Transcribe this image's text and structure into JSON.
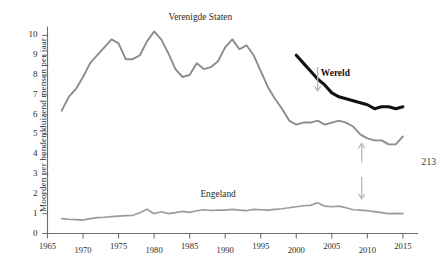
{
  "page": {
    "page_number": "213"
  },
  "chart_data": {
    "type": "line",
    "title": "",
    "xlabel": "",
    "ylabel": "Moorden per honderdduizend mensen per jaar",
    "xlim": [
      1965,
      2016
    ],
    "ylim": [
      0,
      10.5
    ],
    "grid": false,
    "legend_position": "inline-annotations",
    "xticks": [
      "1965",
      "1970",
      "1975",
      "1980",
      "1985",
      "1990",
      "1995",
      "2000",
      "2005",
      "2010",
      "2015"
    ],
    "xtick_values": [
      1965,
      1970,
      1975,
      1980,
      1985,
      1990,
      1995,
      2000,
      2005,
      2010,
      2015
    ],
    "yticks": [
      "0",
      "1",
      "2",
      "3",
      "4",
      "5",
      "6",
      "7",
      "8",
      "9",
      "10"
    ],
    "ytick_values": [
      0,
      1,
      2,
      3,
      4,
      5,
      6,
      7,
      8,
      9,
      10
    ],
    "colors": {
      "verenigde_staten": "#8c8c8c",
      "engeland": "#9b9b9b",
      "wereld": "#111111",
      "axis": "#6e6e6e",
      "arrow": "#b8b8b8"
    },
    "series": [
      {
        "name": "Verenigde Staten",
        "color": "#8c8c8c",
        "width": 1.9,
        "label_x": 1986.5,
        "label_y": 10.9,
        "x": [
          1967,
          1968,
          1969,
          1970,
          1971,
          1972,
          1973,
          1974,
          1975,
          1976,
          1977,
          1978,
          1979,
          1980,
          1981,
          1982,
          1983,
          1984,
          1985,
          1986,
          1987,
          1988,
          1989,
          1990,
          1991,
          1992,
          1993,
          1994,
          1995,
          1996,
          1997,
          1998,
          1999,
          2000,
          2001,
          2002,
          2003,
          2004,
          2005,
          2006,
          2007,
          2008,
          2009,
          2010,
          2011,
          2012,
          2013,
          2014,
          2015
        ],
        "y": [
          6.2,
          6.9,
          7.3,
          7.9,
          8.6,
          9.0,
          9.4,
          9.8,
          9.6,
          8.8,
          8.8,
          9.0,
          9.7,
          10.2,
          9.8,
          9.1,
          8.3,
          7.9,
          8.0,
          8.6,
          8.3,
          8.4,
          8.7,
          9.4,
          9.8,
          9.3,
          9.5,
          9.0,
          8.2,
          7.4,
          6.8,
          6.3,
          5.7,
          5.5,
          5.6,
          5.6,
          5.7,
          5.5,
          5.6,
          5.7,
          5.6,
          5.4,
          5.0,
          4.8,
          4.7,
          4.7,
          4.5,
          4.5,
          4.9
        ]
      },
      {
        "name": "Engeland",
        "color": "#9b9b9b",
        "width": 1.7,
        "label_x": 1989.0,
        "label_y": 1.95,
        "x": [
          1967,
          1968,
          1969,
          1970,
          1971,
          1972,
          1973,
          1974,
          1975,
          1976,
          1977,
          1978,
          1979,
          1980,
          1981,
          1982,
          1983,
          1984,
          1985,
          1986,
          1987,
          1988,
          1989,
          1990,
          1991,
          1992,
          1993,
          1994,
          1995,
          1996,
          1997,
          1998,
          1999,
          2000,
          2001,
          2002,
          2003,
          2004,
          2005,
          2006,
          2007,
          2008,
          2009,
          2010,
          2011,
          2012,
          2013,
          2014,
          2015
        ],
        "y": [
          0.75,
          0.72,
          0.7,
          0.68,
          0.75,
          0.8,
          0.82,
          0.85,
          0.88,
          0.9,
          0.92,
          1.05,
          1.22,
          1.0,
          1.1,
          1.0,
          1.05,
          1.12,
          1.07,
          1.15,
          1.2,
          1.16,
          1.18,
          1.18,
          1.22,
          1.18,
          1.15,
          1.22,
          1.2,
          1.18,
          1.22,
          1.25,
          1.3,
          1.35,
          1.4,
          1.42,
          1.55,
          1.38,
          1.35,
          1.38,
          1.3,
          1.2,
          1.18,
          1.15,
          1.1,
          1.05,
          1.0,
          1.02,
          1.0
        ]
      },
      {
        "name": "Wereld",
        "color": "#111111",
        "width": 3.1,
        "label_x": 2005.5,
        "label_y": 8.05,
        "x": [
          2000,
          2001,
          2002,
          2003,
          2004,
          2005,
          2006,
          2007,
          2008,
          2009,
          2010,
          2011,
          2012,
          2013,
          2014,
          2015
        ],
        "y": [
          9.0,
          8.6,
          8.2,
          7.8,
          7.5,
          7.1,
          6.9,
          6.8,
          6.7,
          6.6,
          6.5,
          6.3,
          6.4,
          6.4,
          6.3,
          6.4
        ]
      }
    ],
    "annotations": [
      {
        "name": "wereld-down-arrow",
        "x": 2003.0,
        "y_from": 8.4,
        "y_to": 7.2,
        "direction": "down"
      },
      {
        "name": "us-up-arrow",
        "x": 2009.2,
        "y_from": 3.6,
        "y_to": 4.55,
        "direction": "up"
      },
      {
        "name": "engeland-down-arrow",
        "x": 2009.2,
        "y_from": 2.85,
        "y_to": 1.75,
        "direction": "down"
      }
    ]
  }
}
